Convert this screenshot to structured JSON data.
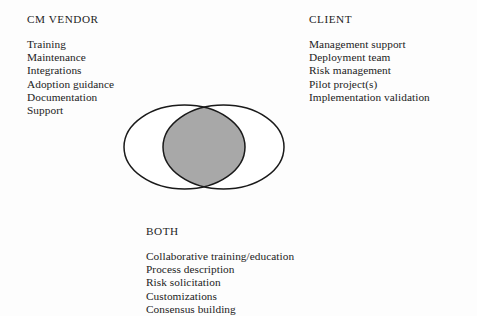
{
  "page": {
    "background_color": "#fdfdfd",
    "text_color": "#1c1c1c"
  },
  "diagram": {
    "type": "venn-2-set",
    "outline_color": "#1a1a1a",
    "outline_width": 1.5,
    "left_circle_fill": "#ffffff",
    "right_circle_fill": "#ffffff",
    "intersection_fill": "#a8a8a8",
    "left_ellipse": {
      "cx": 66.5,
      "cy": 48,
      "rx": 60.5,
      "ry": 42
    },
    "right_ellipse": {
      "cx": 105.5,
      "cy": 48,
      "rx": 60.5,
      "ry": 42
    }
  },
  "groups": {
    "vendor": {
      "heading": "CM VENDOR",
      "items": [
        "Training",
        "Maintenance",
        "Integrations",
        "Adoption guidance",
        "Documentation",
        "Support"
      ]
    },
    "client": {
      "heading": "CLIENT",
      "items": [
        "Management support",
        "Deployment team",
        "Risk management",
        "Pilot project(s)",
        "Implementation validation"
      ]
    },
    "both": {
      "heading": "BOTH",
      "items": [
        "Collaborative training/education",
        "Process description",
        "Risk solicitation",
        "Customizations",
        "Consensus building"
      ]
    }
  }
}
